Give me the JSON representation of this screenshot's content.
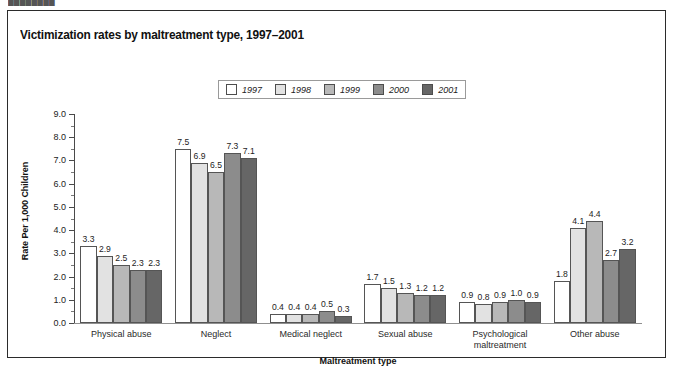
{
  "top_fragment": "████████",
  "figure": {
    "title": "Victimization rates by maltreatment type, 1997–2001"
  },
  "chart_data": {
    "type": "bar",
    "title": "Victimization rates by maltreatment type, 1997–2001",
    "xlabel": "Maltreatment type",
    "ylabel": "Rate Per 1,000 Children",
    "ylim": [
      0.0,
      9.0
    ],
    "ytick_step": 1.0,
    "yticks": [
      "0.0",
      "1.0",
      "2.0",
      "3.0",
      "4.0",
      "5.0",
      "6.0",
      "7.0",
      "8.0",
      "9.0"
    ],
    "minor_tick_step": 0.5,
    "grid": false,
    "legend_position": "top-center",
    "categories": [
      "Physical abuse",
      "Neglect",
      "Medical neglect",
      "Sexual abuse",
      "Psychological\nmaltreatment",
      "Other abuse"
    ],
    "series": [
      {
        "name": "1997",
        "color": "#ffffff",
        "values": [
          3.3,
          7.5,
          0.4,
          1.7,
          0.9,
          1.8
        ]
      },
      {
        "name": "1998",
        "color": "#e2e2e2",
        "values": [
          2.9,
          6.9,
          0.4,
          1.5,
          0.8,
          4.1
        ]
      },
      {
        "name": "1999",
        "color": "#b8b8b8",
        "values": [
          2.5,
          6.5,
          0.4,
          1.3,
          0.9,
          4.4
        ]
      },
      {
        "name": "2000",
        "color": "#8c8c8c",
        "values": [
          2.3,
          7.3,
          0.5,
          1.2,
          1.0,
          2.7
        ]
      },
      {
        "name": "2001",
        "color": "#666666",
        "values": [
          2.3,
          7.1,
          0.3,
          1.2,
          0.9,
          3.2
        ]
      }
    ],
    "data_labels": [
      [
        "3.3",
        "2.9",
        "2.5",
        "2.3",
        "2.3"
      ],
      [
        "7.5",
        "6.9",
        "6.5",
        "7.3",
        "7.1"
      ],
      [
        "0.4",
        "0.4",
        "0.4",
        "0.5",
        "0.3"
      ],
      [
        "1.7",
        "1.5",
        "1.3",
        "1.2",
        "1.2"
      ],
      [
        "0.9",
        "0.8",
        "0.9",
        "1.0",
        "0.9"
      ],
      [
        "1.8",
        "4.1",
        "4.4",
        "2.7",
        "3.2"
      ]
    ]
  }
}
